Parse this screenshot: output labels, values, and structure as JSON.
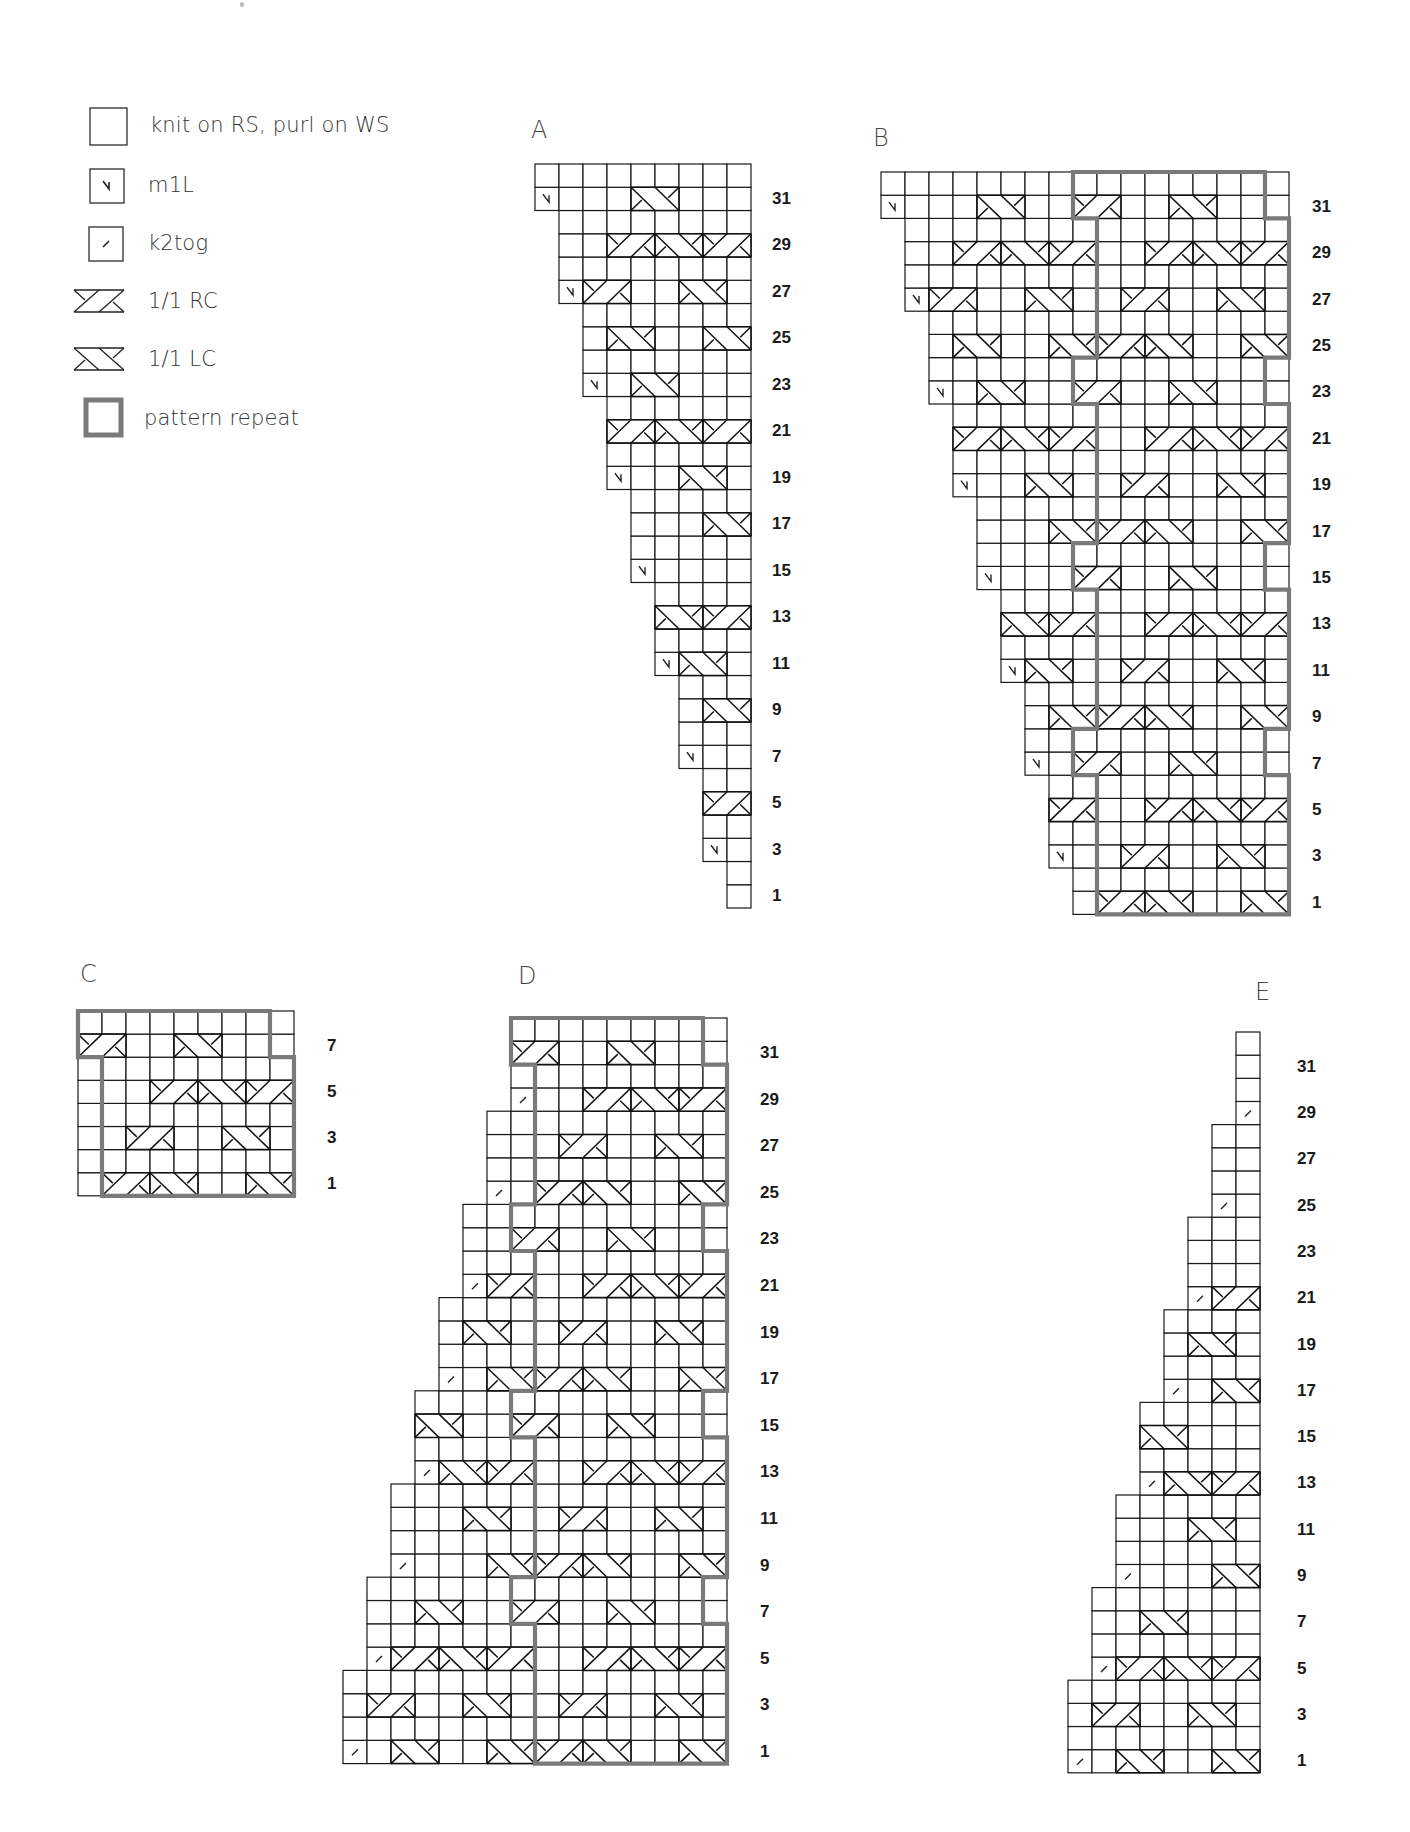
{
  "legend": {
    "items": [
      {
        "symbol": "knit",
        "label": "knit on RS, purl on WS"
      },
      {
        "symbol": "m1L",
        "label": "m1L"
      },
      {
        "symbol": "k2tog",
        "label": "k2tog"
      },
      {
        "symbol": "rc",
        "label": "1/1 RC"
      },
      {
        "symbol": "lc",
        "label": "1/1 LC"
      },
      {
        "symbol": "repeat",
        "label": "pattern repeat"
      }
    ]
  },
  "colors": {
    "grid_line": "#1a1a1a",
    "repeat_outline": "#7a7a7a",
    "background": "#ffffff"
  },
  "lattice": {
    "period": 8,
    "cables_by_row_mod8": {
      "1": [
        {
          "u": 0,
          "type": "rc"
        },
        {
          "u": 2,
          "type": "lc"
        },
        {
          "u": 6,
          "type": "lc"
        }
      ],
      "3": [
        {
          "u": 1,
          "type": "rc"
        },
        {
          "u": 5,
          "type": "lc"
        }
      ],
      "5": [
        {
          "u": 2,
          "type": "rc"
        },
        {
          "u": 4,
          "type": "lc"
        },
        {
          "u": 6,
          "type": "rc"
        }
      ],
      "7": [
        {
          "u": 7,
          "type": "rc"
        },
        {
          "u": 3,
          "type": "lc"
        }
      ]
    }
  },
  "charts": [
    {
      "id": "A",
      "title": "A",
      "cols": 9,
      "rows": 32,
      "origin": {
        "x": 535,
        "y": 164
      },
      "cell": {
        "w": 24,
        "h": 23.25
      },
      "title_pos": {
        "x": 531,
        "y": 116
      },
      "label_x": 772,
      "offset": 9,
      "edge": {
        "mode": "increase",
        "base": 8,
        "shaping": "m1L"
      },
      "repeat": null,
      "row_labels": [
        "1",
        "3",
        "5",
        "7",
        "9",
        "11",
        "13",
        "15",
        "17",
        "19",
        "21",
        "23",
        "25",
        "27",
        "29",
        "31"
      ]
    },
    {
      "id": "B",
      "title": "B",
      "cols": 17,
      "rows": 32,
      "origin": {
        "x": 881,
        "y": 172
      },
      "cell": {
        "w": 24,
        "h": 23.2
      },
      "title_pos": {
        "x": 873,
        "y": 124
      },
      "label_x": 1312,
      "offset": 9,
      "edge": {
        "mode": "increase",
        "base": 8,
        "shaping": "m1L"
      },
      "repeat": {
        "start": 9,
        "width": 8,
        "jog_rows_mod8": [
          7,
          0
        ],
        "jog": -1
      },
      "row_labels": [
        "1",
        "3",
        "5",
        "7",
        "9",
        "11",
        "13",
        "15",
        "17",
        "19",
        "21",
        "23",
        "25",
        "27",
        "29",
        "31"
      ]
    },
    {
      "id": "C",
      "title": "C",
      "cols": 9,
      "rows": 8,
      "origin": {
        "x": 78,
        "y": 1011
      },
      "cell": {
        "w": 24,
        "h": 23.1
      },
      "title_pos": {
        "x": 80,
        "y": 960
      },
      "label_x": 327,
      "offset": 1,
      "edge": {
        "mode": "full"
      },
      "repeat": {
        "start": 1,
        "width": 8,
        "jog_rows_mod8": [
          7,
          0
        ],
        "jog": -1
      },
      "row_labels": [
        "1",
        "3",
        "5",
        "7"
      ]
    },
    {
      "id": "D",
      "title": "D",
      "cols": 16,
      "rows": 32,
      "origin": {
        "x": 343,
        "y": 1018
      },
      "cell": {
        "w": 24,
        "h": 23.3
      },
      "title_pos": {
        "x": 518,
        "y": 962
      },
      "label_x": 760,
      "offset": 8,
      "edge": {
        "mode": "decrease",
        "shaping": "k2tog"
      },
      "repeat": {
        "start": 8,
        "width": 8,
        "jog_rows_mod8": [
          7,
          0
        ],
        "jog": -1
      },
      "row_labels": [
        "1",
        "3",
        "5",
        "7",
        "9",
        "11",
        "13",
        "15",
        "17",
        "19",
        "21",
        "23",
        "25",
        "27",
        "29",
        "31"
      ]
    },
    {
      "id": "E",
      "title": "E",
      "cols": 8,
      "rows": 32,
      "origin": {
        "x": 1068,
        "y": 1032
      },
      "cell": {
        "w": 24,
        "h": 23.15
      },
      "title_pos": {
        "x": 1255,
        "y": 978
      },
      "label_x": 1297,
      "offset": 0,
      "edge": {
        "mode": "decrease",
        "shaping": "k2tog"
      },
      "repeat": null,
      "row_labels": [
        "1",
        "3",
        "5",
        "7",
        "9",
        "11",
        "13",
        "15",
        "17",
        "19",
        "21",
        "23",
        "25",
        "27",
        "29",
        "31"
      ]
    }
  ]
}
